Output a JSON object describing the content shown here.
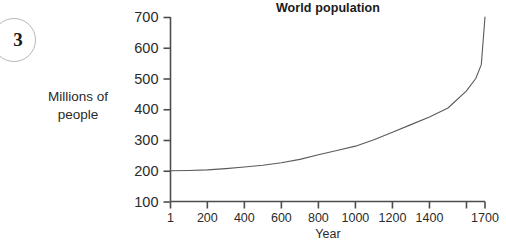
{
  "badge": {
    "number": "3"
  },
  "chart_data": {
    "type": "line",
    "title": "World population",
    "xlabel": "Year",
    "ylabel": "Millions of people",
    "ylabel_lines": [
      "Millions of",
      "people"
    ],
    "grid": false,
    "legend": "none",
    "xlim": [
      1,
      1700
    ],
    "ylim": [
      100,
      700
    ],
    "x_ticks": [
      1,
      200,
      400,
      600,
      800,
      1000,
      1200,
      1400,
      1600,
      1700
    ],
    "x_tick_labels": [
      "1",
      "200",
      "400",
      "600",
      "800",
      "1000",
      "1200",
      "1400",
      "",
      "1700"
    ],
    "y_ticks": [
      100,
      200,
      300,
      400,
      500,
      600,
      700
    ],
    "y_tick_labels": [
      "100",
      "200",
      "300",
      "400",
      "500",
      "600",
      "700"
    ],
    "series": [
      {
        "name": "World population",
        "line_color": "#5a5a5a",
        "x": [
          1,
          100,
          200,
          300,
          400,
          500,
          600,
          700,
          800,
          900,
          1000,
          1100,
          1200,
          1300,
          1400,
          1500,
          1600,
          1650,
          1680,
          1700
        ],
        "values": [
          200,
          201,
          203,
          207,
          212,
          218,
          226,
          237,
          252,
          266,
          280,
          301,
          325,
          350,
          375,
          404,
          460,
          500,
          545,
          700
        ]
      }
    ]
  }
}
